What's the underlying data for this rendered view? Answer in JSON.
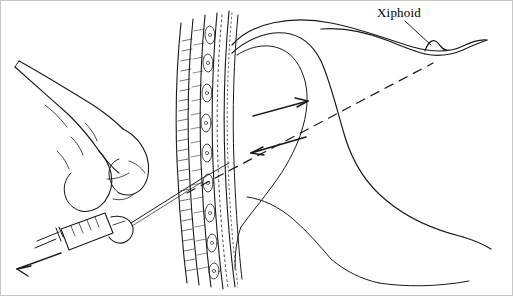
{
  "figure": {
    "background_color": "#ffffff",
    "line_color": "#1a1a1a",
    "labels": [
      {
        "id": "xiphoid",
        "text": "Xiphoid",
        "x": 376,
        "y": 4
      }
    ],
    "annotations": {
      "leader_line": "line from Xiphoid label down to anterior body surface notch",
      "dashed_trajectory": "dashed line from needle tip to xiphoid region",
      "arrow_upper": "solid arrow pointing up-right along trajectory",
      "arrow_lower": "solid arrow pointing down-left along trajectory",
      "syringe_arrow": "solid arrow at lower-left indicating aspiration direction"
    },
    "elements": {
      "hand": "hand holding syringe at left",
      "syringe": "syringe barrel with plunger, lower left",
      "needle": "needle passing through tissue layers",
      "tissue_layers": "stacked skin, fat, muscle and fascia layers (vertical band)",
      "body_outline": "curved body / liver-diaphragm silhouette at right"
    }
  }
}
